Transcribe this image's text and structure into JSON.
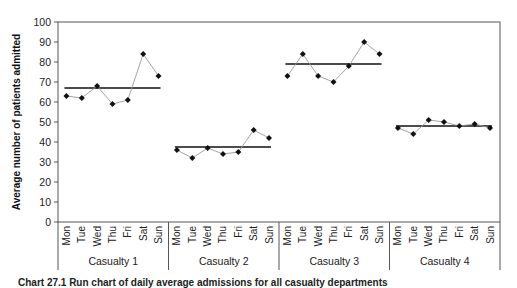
{
  "chart_data": {
    "type": "line",
    "title": "",
    "xlabel": "",
    "ylabel": "Average number of patients admitted",
    "ylim": [
      0,
      100
    ],
    "yticks": [
      0,
      10,
      20,
      30,
      40,
      50,
      60,
      70,
      80,
      90,
      100
    ],
    "grid": false,
    "legend": null,
    "days": [
      "Mon",
      "Tue",
      "Wed",
      "Thu",
      "Fri",
      "Sat",
      "Sun"
    ],
    "groups": [
      {
        "name": "Casualty 1",
        "values": [
          63,
          62,
          68,
          59,
          61,
          84,
          73
        ],
        "mean": 67
      },
      {
        "name": "Casualty 2",
        "values": [
          36,
          32,
          37,
          34,
          35,
          46,
          42
        ],
        "mean": 37.5
      },
      {
        "name": "Casualty 3",
        "values": [
          73,
          84,
          73,
          70,
          78,
          90,
          84
        ],
        "mean": 79
      },
      {
        "name": "Casualty 4",
        "values": [
          47,
          44,
          51,
          50,
          48,
          49,
          47
        ],
        "mean": 48
      }
    ],
    "annotations": "Horizontal bar in each group marks the group mean"
  },
  "caption": "Chart 27.1 Run chart of daily average admissions for all casualty departments",
  "colors": {
    "data_line": "#9a9a9a",
    "marker": "#111111",
    "mean_line": "#111111",
    "axis": "#555555"
  }
}
